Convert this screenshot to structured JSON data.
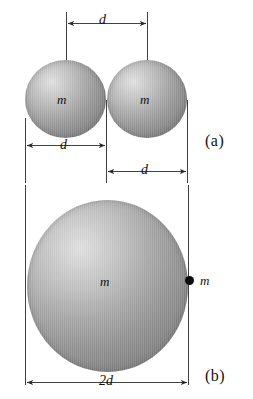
{
  "figure": {
    "background_color": "#ffffff",
    "line_color": "#2b2b2b",
    "sphere_color_light": "#e2e2e2",
    "sphere_color_dark": "#7d7d7d",
    "point_mass_color": "#0d0d0d",
    "panels": [
      {
        "id": "a",
        "label": "(a)",
        "description": "Two equal spheres of mass m, each of diameter d, touching, centers separated by d",
        "spheres": [
          {
            "mass_label": "m",
            "diameter_label": "d"
          },
          {
            "mass_label": "m",
            "diameter_label": "d"
          }
        ],
        "dimensions": [
          {
            "name": "center-separation",
            "label": "d"
          },
          {
            "name": "sphere-diameter",
            "label": "d"
          },
          {
            "name": "right-sphere-diameter",
            "label": "d"
          }
        ]
      },
      {
        "id": "b",
        "label": "(b)",
        "description": "One large sphere of mass m and diameter 2d with a point mass m on its surface",
        "spheres": [
          {
            "mass_label": "m",
            "diameter_label": "2d"
          }
        ],
        "point_mass": {
          "mass_label": "m"
        },
        "dimensions": [
          {
            "name": "large-sphere-diameter",
            "label": "2d"
          }
        ]
      }
    ],
    "labels": {
      "mass_a_left": "m",
      "mass_a_right": "m",
      "mass_b_center": "m",
      "mass_b_point": "m",
      "dim_top": "d",
      "dim_diameter": "d",
      "dim_gap": "d",
      "dim_bottom": "2d",
      "panel_a": "(a)",
      "panel_b": "(b)"
    }
  }
}
